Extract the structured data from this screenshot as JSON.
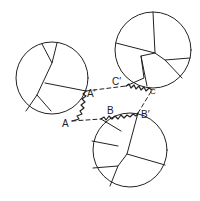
{
  "diagram": {
    "stroke_color": "#222222",
    "background": "#ffffff",
    "circles": [
      {
        "name": "left-grain",
        "cx": 52,
        "cy": 78,
        "r": 36
      },
      {
        "name": "top-right-grain",
        "cx": 153,
        "cy": 50,
        "r": 38
      },
      {
        "name": "bottom-grain",
        "cx": 130,
        "cy": 150,
        "r": 37
      }
    ],
    "labels": {
      "A": "A",
      "A_prime": "A′",
      "B": "B",
      "B_prime": "B′",
      "C": "C",
      "C_prime": "C′"
    }
  }
}
